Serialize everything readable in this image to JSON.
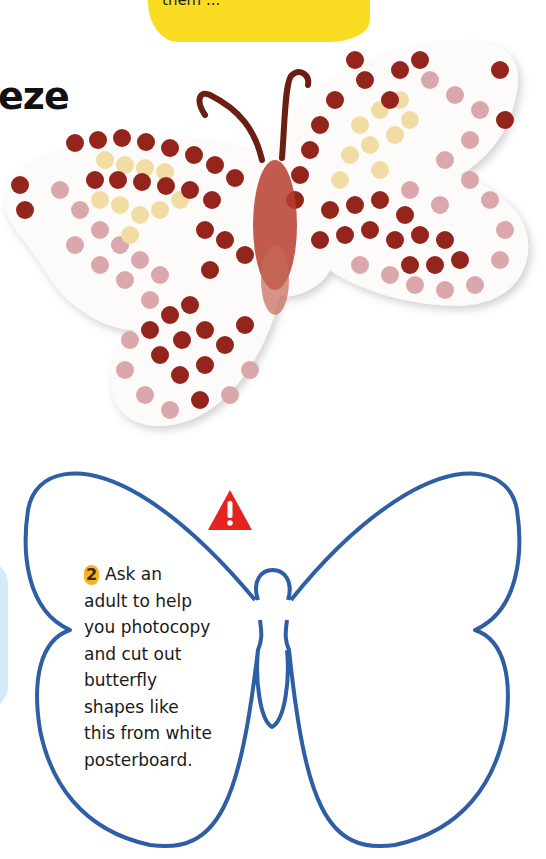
{
  "top_note": {
    "text": "them ...",
    "bg_color": "#f9dc22"
  },
  "heading": {
    "text": "eze"
  },
  "photo": {
    "description": "Finished painted butterfly with fingerprint dots in dark red, pink and cream",
    "colors": {
      "dark_red": "#8e1a12",
      "pink": "#d9a3a8",
      "cream": "#f1dca0",
      "antenna": "#6b1f12"
    }
  },
  "warning": {
    "icon": "warning-triangle-icon",
    "color": "#e52420"
  },
  "step": {
    "number": "2",
    "text": "Ask an adult to help you photocopy and cut out butterfly shapes like this from white posterboard.",
    "lines": [
      "Ask an",
      "adult to help",
      "you photocopy",
      "and cut out",
      "butterfly",
      "shapes like",
      "this from white",
      "posterboard."
    ]
  },
  "template": {
    "outline_color": "#2e5ea3",
    "description": "Butterfly outline template"
  }
}
